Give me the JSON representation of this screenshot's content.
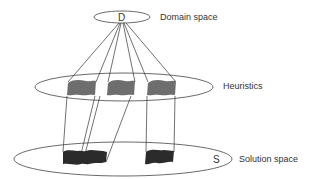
{
  "diagram": {
    "levels": [
      {
        "id": "domain",
        "marker": "D",
        "label": "Domain space"
      },
      {
        "id": "heuristics",
        "marker": "",
        "label": "Heuristics"
      },
      {
        "id": "solution",
        "marker": "S",
        "label": "Solution space"
      }
    ],
    "heuristic_region_count": 3,
    "solution_region_count": 2,
    "colors": {
      "heuristic_fill": "#6e6e6e",
      "solution_fill": "#2b2b2b",
      "outline": "#444444",
      "text": "#333333"
    }
  }
}
